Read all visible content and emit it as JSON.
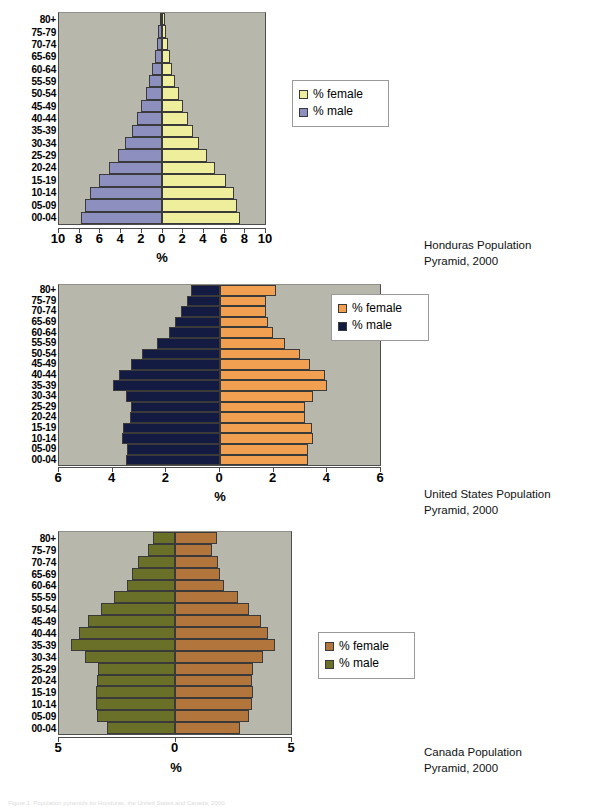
{
  "page": {
    "footer_note": "Figure 1. Population pyramids for Honduras, the United States and Canada, 2000."
  },
  "age_groups": [
    "80+",
    "75-79",
    "70-74",
    "65-69",
    "60-64",
    "55-59",
    "50-54",
    "45-49",
    "40-44",
    "35-39",
    "30-34",
    "25-29",
    "20-24",
    "15-19",
    "10-14",
    "05-09",
    "00-04"
  ],
  "charts": [
    {
      "id": "honduras",
      "caption": "Honduras Population\nPyramid, 2000",
      "xlabel": "%",
      "xticks": [
        "10",
        "8",
        "6",
        "4",
        "2",
        "0",
        "2",
        "4",
        "6",
        "8",
        "10"
      ],
      "xmax": 10,
      "legend": {
        "female": "% female",
        "male": "% male"
      },
      "colors": {
        "female": "#eeee9c",
        "male": "#8d8fbf",
        "plot_bg": "#b7b7ab",
        "border": "#3a3a3a"
      },
      "chart_data": {
        "type": "bar",
        "title": "Honduras Population Pyramid, 2000",
        "xlabel": "%",
        "ylabel": "",
        "xlim": [
          -10,
          10
        ],
        "grid": false,
        "legend_position": "right",
        "categories": [
          "80+",
          "75-79",
          "70-74",
          "65-69",
          "60-64",
          "55-59",
          "50-54",
          "45-49",
          "40-44",
          "35-39",
          "30-34",
          "25-29",
          "20-24",
          "15-19",
          "10-14",
          "05-09",
          "00-04"
        ],
        "series": [
          {
            "name": "% male",
            "values": [
              0.2,
              0.35,
              0.5,
              0.7,
              0.95,
              1.25,
              1.6,
              2.0,
              2.45,
              2.95,
              3.55,
              4.3,
              5.1,
              6.1,
              7.0,
              7.5,
              7.9
            ]
          },
          {
            "name": "% female",
            "values": [
              0.25,
              0.4,
              0.55,
              0.75,
              1.0,
              1.3,
              1.65,
              2.05,
              2.5,
              3.0,
              3.6,
              4.35,
              5.15,
              6.2,
              7.0,
              7.3,
              7.6
            ]
          }
        ]
      }
    },
    {
      "id": "united-states",
      "caption": "United States Population\nPyramid, 2000",
      "xlabel": "%",
      "xticks": [
        "6",
        "4",
        "2",
        "0",
        "2",
        "4",
        "6"
      ],
      "xmax": 6,
      "legend": {
        "female": "% female",
        "male": "% male"
      },
      "colors": {
        "female": "#f0a050",
        "male": "#141b42",
        "plot_bg": "#b7b7ab",
        "border": "#3a3a3a"
      },
      "chart_data": {
        "type": "bar",
        "title": "United States Population Pyramid, 2000",
        "xlabel": "%",
        "ylabel": "",
        "xlim": [
          -6,
          6
        ],
        "grid": false,
        "legend_position": "right",
        "categories": [
          "80+",
          "75-79",
          "70-74",
          "65-69",
          "60-64",
          "55-59",
          "50-54",
          "45-49",
          "40-44",
          "35-39",
          "30-34",
          "25-29",
          "20-24",
          "15-19",
          "10-14",
          "05-09",
          "00-04"
        ],
        "series": [
          {
            "name": "% male",
            "values": [
              1.05,
              1.2,
              1.45,
              1.65,
              1.9,
              2.35,
              2.9,
              3.3,
              3.75,
              4.0,
              3.5,
              3.3,
              3.35,
              3.6,
              3.65,
              3.45,
              3.5
            ]
          },
          {
            "name": "% female",
            "values": [
              2.1,
              1.75,
              1.75,
              1.8,
              2.0,
              2.45,
              3.0,
              3.4,
              3.95,
              4.0,
              3.5,
              3.2,
              3.2,
              3.45,
              3.5,
              3.3,
              3.3
            ]
          }
        ]
      }
    },
    {
      "id": "canada",
      "caption": "Canada Population\nPyramid, 2000",
      "xlabel": "%",
      "xticks": [
        "5",
        "0",
        "5"
      ],
      "xmax": 5,
      "legend": {
        "female": "% female",
        "male": "% male"
      },
      "colors": {
        "female": "#b2763c",
        "male": "#6b7029",
        "plot_bg": "#b7b7ab",
        "border": "#3a3a3a"
      },
      "chart_data": {
        "type": "bar",
        "title": "Canada Population Pyramid, 2000",
        "xlabel": "%",
        "ylabel": "",
        "xlim": [
          -5,
          5
        ],
        "grid": false,
        "legend_position": "right",
        "categories": [
          "80+",
          "75-79",
          "70-74",
          "65-69",
          "60-64",
          "55-59",
          "50-54",
          "45-49",
          "40-44",
          "35-39",
          "30-34",
          "25-29",
          "20-24",
          "15-19",
          "10-14",
          "05-09",
          "00-04"
        ],
        "series": [
          {
            "name": "% male",
            "values": [
              0.95,
              1.15,
              1.6,
              1.85,
              2.05,
              2.65,
              3.2,
              3.75,
              4.15,
              4.5,
              3.9,
              3.3,
              3.35,
              3.4,
              3.4,
              3.35,
              2.95
            ]
          },
          {
            "name": "% female",
            "values": [
              1.8,
              1.6,
              1.85,
              1.95,
              2.1,
              2.7,
              3.2,
              3.7,
              4.0,
              4.3,
              3.8,
              3.35,
              3.3,
              3.35,
              3.3,
              3.2,
              2.8
            ]
          }
        ]
      }
    }
  ]
}
